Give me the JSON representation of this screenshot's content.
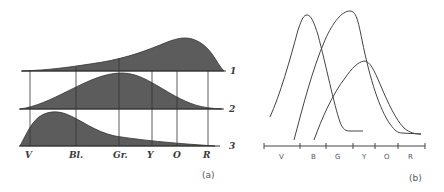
{
  "panel_a": {
    "caption": "(a)",
    "band_labels": [
      "V",
      "Bl.",
      "Gr.",
      "Y",
      "O",
      "R"
    ],
    "curve_labels": [
      "1",
      "2",
      "3"
    ],
    "curves": [
      {
        "id": "1",
        "peak_position": "O",
        "description": "long-wave response, peaks near orange"
      },
      {
        "id": "2",
        "peak_position": "Gr.",
        "description": "middle-wave response, peaks near green"
      },
      {
        "id": "3",
        "peak_position": "between V and Bl.",
        "description": "short-wave response, peaks near violet/blue"
      }
    ],
    "fill_color": "#5a5a5a"
  },
  "panel_b": {
    "caption": "(b)",
    "axis_labels": [
      "V",
      "B",
      "G",
      "Y",
      "O",
      "R"
    ],
    "curves": [
      {
        "id": "short",
        "peak_position": "B (left edge)"
      },
      {
        "id": "middle",
        "peak_position": "between G and Y"
      },
      {
        "id": "long",
        "peak_position": "Y"
      }
    ],
    "line_color": "#444444"
  }
}
